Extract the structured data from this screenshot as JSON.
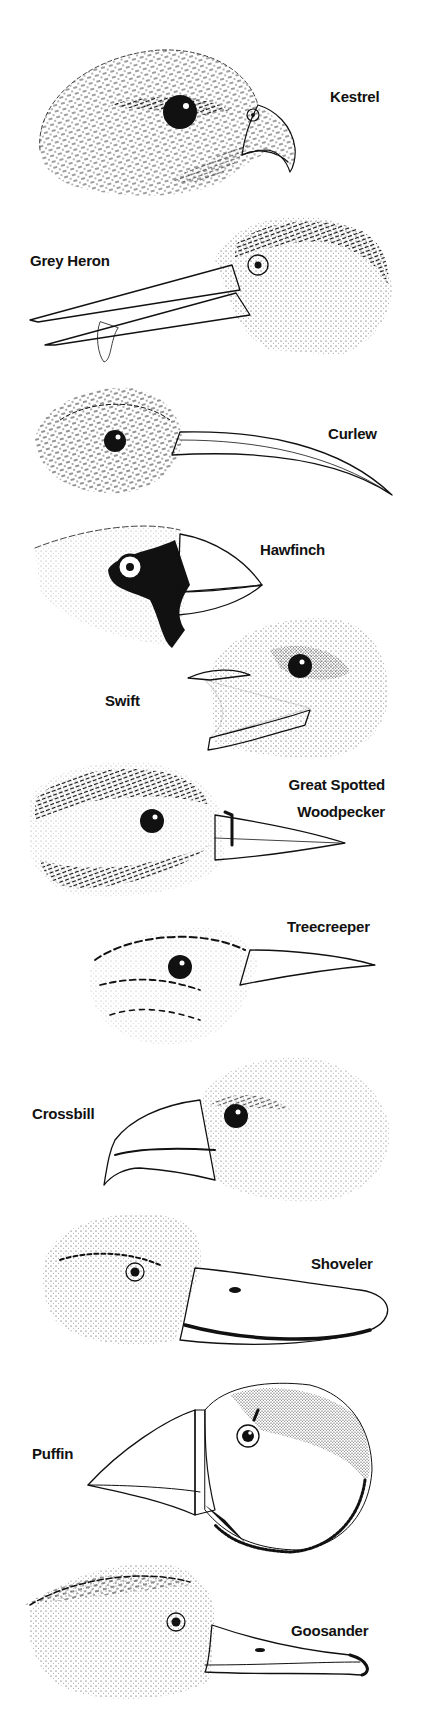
{
  "colors": {
    "ink": "#111111",
    "paper": "#ffffff"
  },
  "birds": [
    {
      "id": "kestrel",
      "label": "Kestrel",
      "bill": "hooked"
    },
    {
      "id": "grey-heron",
      "label": "Grey Heron",
      "bill": "dagger"
    },
    {
      "id": "curlew",
      "label": "Curlew",
      "bill": "long-decurved"
    },
    {
      "id": "hawfinch",
      "label": "Hawfinch",
      "bill": "conical-heavy"
    },
    {
      "id": "swift",
      "label": "Swift",
      "bill": "gape"
    },
    {
      "id": "great-spotted-woodpecker",
      "label_line1": "Great Spotted",
      "label_line2": "Woodpecker",
      "bill": "chisel"
    },
    {
      "id": "treecreeper",
      "label": "Treecreeper",
      "bill": "fine-decurved"
    },
    {
      "id": "crossbill",
      "label": "Crossbill",
      "bill": "crossed"
    },
    {
      "id": "shoveler",
      "label": "Shoveler",
      "bill": "spatulate"
    },
    {
      "id": "puffin",
      "label": "Puffin",
      "bill": "deep-laterally-compressed"
    },
    {
      "id": "goosander",
      "label": "Goosander",
      "bill": "serrated-hooked"
    }
  ]
}
